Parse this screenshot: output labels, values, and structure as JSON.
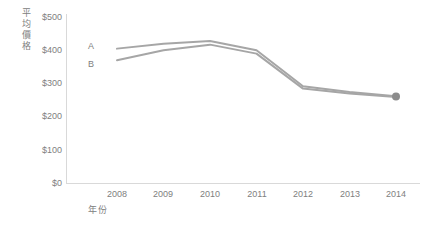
{
  "chart_data": {
    "type": "line",
    "title": "",
    "xlabel": "年份",
    "ylabel": "平均價格",
    "x": [
      2008,
      2009,
      2010,
      2011,
      2012,
      2013,
      2014
    ],
    "categories": [
      "2008",
      "2009",
      "2010",
      "2011",
      "2012",
      "2013",
      "2014"
    ],
    "series": [
      {
        "name": "A",
        "values": [
          405,
          420,
          428,
          400,
          292,
          275,
          262
        ]
      },
      {
        "name": "B",
        "values": [
          370,
          400,
          417,
          390,
          285,
          270,
          260
        ]
      }
    ],
    "ylim": [
      0,
      500
    ],
    "ytick_labels": [
      "$0",
      "$100",
      "$200",
      "$300",
      "$400",
      "$500"
    ],
    "ytick_values": [
      0,
      100,
      200,
      300,
      400,
      500
    ],
    "xtick_labels": [
      "2008",
      "2009",
      "2010",
      "2011",
      "2012",
      "2013",
      "2014"
    ],
    "grid": false,
    "legend": "inline-series-labels",
    "line_color": "#a6a6a6",
    "axis_color": "#d9d9d9",
    "text_color": "#808080",
    "marker_color": "#8c8c8c",
    "annotations": [
      {
        "text": "A",
        "series": "A"
      },
      {
        "text": "B",
        "series": "B"
      }
    ]
  }
}
